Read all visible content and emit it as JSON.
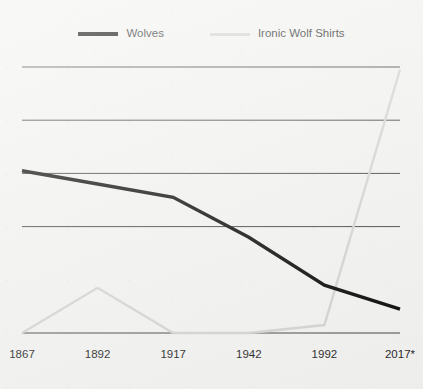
{
  "legend": {
    "entries": [
      {
        "label": "Wolves",
        "color": "#000000",
        "swatch_icon": "line-swatch-icon"
      },
      {
        "label": "Ironic Wolf Shirts",
        "color": "#d2d2d2",
        "swatch_icon": "line-swatch-icon"
      }
    ]
  },
  "colors": {
    "background": "#f2f2f0",
    "gridline": "#3a3a3a",
    "wolves": "#000000",
    "shirts": "#d2d2d2",
    "text": "#1d1d1d"
  },
  "chart_data": {
    "type": "line",
    "title": "",
    "subtitle": "",
    "xlabel": "",
    "ylabel": "",
    "categories": [
      "1867",
      "1892",
      "1917",
      "1942",
      "1992",
      "2017*"
    ],
    "tick_labels": [
      "1867",
      "1892",
      "1917",
      "1942",
      "1992",
      "2017*"
    ],
    "xlim": [
      0,
      5
    ],
    "ylim": [
      0,
      100
    ],
    "grid": true,
    "gridlines_y": [
      100,
      80,
      60,
      40,
      0
    ],
    "y_axis_labels_shown": false,
    "legend_position": "top-center",
    "annotations": [
      "2017*"
    ],
    "series": [
      {
        "name": "Wolves",
        "color": "#000000",
        "values": [
          61,
          56,
          51,
          36,
          18,
          9
        ]
      },
      {
        "name": "Ironic Wolf Shirts",
        "color": "#d2d2d2",
        "values": [
          0,
          17,
          0,
          0,
          3,
          99
        ]
      }
    ]
  }
}
